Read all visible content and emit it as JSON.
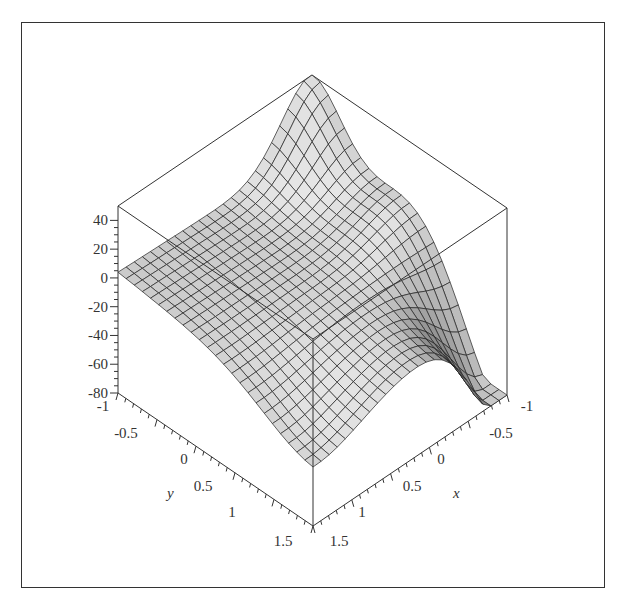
{
  "chart_data": {
    "type": "surface3d",
    "title": "",
    "xlabel": "x",
    "ylabel": "y",
    "zlabel": "",
    "x_range": [
      -1,
      1.5
    ],
    "y_range": [
      -1,
      1.5
    ],
    "z_range": [
      -80,
      50
    ],
    "x_ticks": [
      "-1",
      "-0.5",
      "0",
      "0.5",
      "1",
      "1.5"
    ],
    "y_ticks": [
      "-1",
      "-0.5",
      "0",
      "0.5",
      "1",
      "1.5"
    ],
    "z_ticks": [
      "40",
      "20",
      "0",
      "-20",
      "-40",
      "-60",
      "-80"
    ],
    "grid": false,
    "box": true,
    "mesh_lines": 24,
    "corner_values": {
      "x=-1,y=-1": 50,
      "x=1.5,y=-1": 0,
      "x=-1,y=1.5": -75,
      "x=1.5,y=1.5": -30
    },
    "features": [
      "sharp peak (~50) at x=-1, y=-1",
      "hump (~15) near x=-1, y=0.3",
      "deep trough (~-75) at x=-1, y=1.5",
      "surface near 0 along x=1.5 edge at y=-1"
    ],
    "colors": {
      "surface_dark": "#8c8c8c",
      "surface_light": "#e2e2e2",
      "mesh": "#222222",
      "box": "#333333"
    }
  }
}
